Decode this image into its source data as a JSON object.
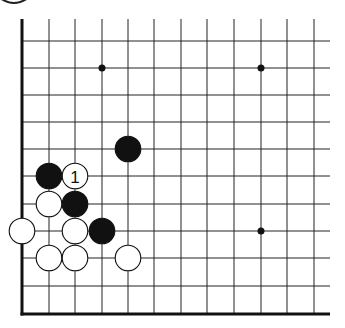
{
  "diagram": {
    "type": "go-board-corner",
    "colors": {
      "background": "#ffffff",
      "line": "#222222",
      "black_stone": "#111111",
      "white_stone": "#ffffff",
      "stone_outline": "#111111"
    },
    "grid": {
      "columns_x": [
        22,
        49,
        75,
        102,
        128,
        154,
        181,
        207,
        234,
        261,
        287,
        314
      ],
      "rows_y": [
        41,
        68,
        95,
        122,
        149,
        176,
        204,
        231,
        258,
        286,
        314
      ],
      "right_extent": 330,
      "top_extent": 19,
      "thick_left_edge": true,
      "thick_bottom_edge": true
    },
    "hoshi": [
      {
        "col": 3,
        "row": 1
      },
      {
        "col": 9,
        "row": 1
      },
      {
        "col": 9,
        "row": 7
      }
    ],
    "stones": [
      {
        "color": "black",
        "col": 4,
        "row": 4,
        "label": ""
      },
      {
        "color": "black",
        "col": 1,
        "row": 5,
        "label": ""
      },
      {
        "color": "white",
        "col": 2,
        "row": 5,
        "label": "1"
      },
      {
        "color": "white",
        "col": 1,
        "row": 6,
        "label": ""
      },
      {
        "color": "black",
        "col": 2,
        "row": 6,
        "label": ""
      },
      {
        "color": "white",
        "col": 0,
        "row": 7,
        "label": ""
      },
      {
        "color": "white",
        "col": 2,
        "row": 7,
        "label": ""
      },
      {
        "color": "black",
        "col": 3,
        "row": 7,
        "label": ""
      },
      {
        "color": "white",
        "col": 1,
        "row": 8,
        "label": ""
      },
      {
        "color": "white",
        "col": 2,
        "row": 8,
        "label": ""
      },
      {
        "color": "white",
        "col": 4,
        "row": 8,
        "label": ""
      }
    ],
    "move_label": "1"
  }
}
